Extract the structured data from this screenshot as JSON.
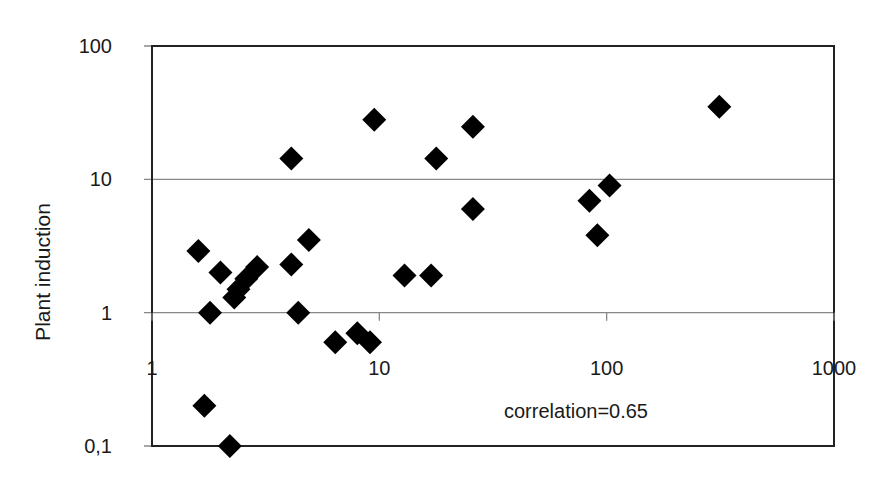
{
  "chart_data": {
    "type": "scatter",
    "title": "",
    "xlabel": "",
    "ylabel": "Plant induction",
    "xscale": "log",
    "yscale": "log",
    "xlim": [
      1,
      1000
    ],
    "ylim": [
      0.1,
      100
    ],
    "x_ticks": [
      1,
      10,
      100,
      1000
    ],
    "x_tick_labels": [
      "1",
      "10",
      "100",
      "1000"
    ],
    "y_ticks": [
      0.1,
      1,
      10,
      100
    ],
    "y_tick_labels": [
      "0,1",
      "1",
      "10",
      "100"
    ],
    "grid": {
      "horizontal": true,
      "vertical": false
    },
    "legend": null,
    "marker": "diamond",
    "marker_color": "#000000",
    "annotation": "correlation=0.65",
    "series": [
      {
        "name": "data",
        "points": [
          {
            "x": 1.6,
            "y": 2.9
          },
          {
            "x": 1.7,
            "y": 0.2
          },
          {
            "x": 1.8,
            "y": 1.0
          },
          {
            "x": 2.0,
            "y": 2.0
          },
          {
            "x": 2.2,
            "y": 0.1
          },
          {
            "x": 2.3,
            "y": 1.3
          },
          {
            "x": 2.4,
            "y": 1.5
          },
          {
            "x": 2.6,
            "y": 1.8
          },
          {
            "x": 2.9,
            "y": 2.2
          },
          {
            "x": 4.1,
            "y": 2.3
          },
          {
            "x": 4.1,
            "y": 14.3
          },
          {
            "x": 4.4,
            "y": 1.0
          },
          {
            "x": 4.9,
            "y": 3.5
          },
          {
            "x": 6.4,
            "y": 0.6
          },
          {
            "x": 8.0,
            "y": 0.7
          },
          {
            "x": 9.1,
            "y": 0.6
          },
          {
            "x": 9.5,
            "y": 28
          },
          {
            "x": 12.9,
            "y": 1.9
          },
          {
            "x": 16.9,
            "y": 1.9
          },
          {
            "x": 17.8,
            "y": 14.3
          },
          {
            "x": 25.8,
            "y": 6.0
          },
          {
            "x": 25.8,
            "y": 24.8
          },
          {
            "x": 84,
            "y": 6.9
          },
          {
            "x": 91,
            "y": 3.8
          },
          {
            "x": 103,
            "y": 9.0
          },
          {
            "x": 313,
            "y": 35
          }
        ]
      }
    ]
  },
  "layout": {
    "plot": {
      "left": 152,
      "right": 834,
      "top": 46,
      "bottom": 446
    }
  }
}
